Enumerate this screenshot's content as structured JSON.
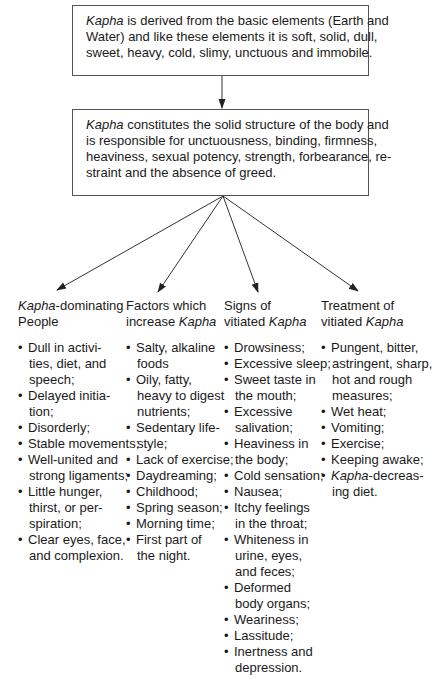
{
  "box_top": {
    "lines": [
      {
        "em": "Kapha",
        "text": " is derived from the basic elements (Earth and"
      },
      {
        "em": "",
        "text": "Water) and like these elements it is soft, solid, dull,"
      },
      {
        "em": "",
        "text": "sweet, heavy, cold, slimy, unctuous and immobile."
      }
    ]
  },
  "box_middle": {
    "lines": [
      {
        "em": "Kapha",
        "text": " constitutes the solid structure of the body and"
      },
      {
        "em": "",
        "text": "is responsible for unctuousness, binding, firmness,"
      },
      {
        "em": "",
        "text": "heaviness, sexual potency, strength, forbearance, re-"
      },
      {
        "em": "",
        "text": "straint and the absence of greed."
      }
    ]
  },
  "bullet_glyph": "•",
  "columns": [
    {
      "heading_lines": [
        {
          "em": "Kapha",
          "text": "-dominating"
        },
        {
          "em": "",
          "text": "People"
        }
      ],
      "items": [
        [
          "Dull in activi-",
          "ties, diet, and",
          "speech;"
        ],
        [
          "Delayed initia-",
          "tion;"
        ],
        [
          "Disorderly;"
        ],
        [
          "Stable movements;"
        ],
        [
          "Well-united and",
          "strong ligaments;"
        ],
        [
          "Little hunger,",
          "thirst, or per-",
          "spiration;"
        ],
        [
          "Clear eyes, face,",
          "and complexion."
        ]
      ]
    },
    {
      "heading_lines": [
        {
          "em": "",
          "text": "Factors which"
        },
        {
          "em_after": "Kapha",
          "text": "increase "
        }
      ],
      "items": [
        [
          "Salty, alkaline",
          "foods"
        ],
        [
          "Oily, fatty,",
          "heavy to digest",
          "nutrients;"
        ],
        [
          "Sedentary life-",
          "style;"
        ],
        [
          "Lack of exercise;"
        ],
        [
          "Daydreaming;"
        ],
        [
          "Childhood;"
        ],
        [
          "Spring season;"
        ],
        [
          "Morning time;"
        ],
        [
          "First part of",
          "the night."
        ]
      ]
    },
    {
      "heading_lines": [
        {
          "em": "",
          "text": "Signs of"
        },
        {
          "em_after": "Kapha",
          "text": "vitiated "
        }
      ],
      "items": [
        [
          "Drowsiness;"
        ],
        [
          "Excessive sleep;"
        ],
        [
          "Sweet taste in",
          "the mouth;"
        ],
        [
          "Excessive",
          "salivation;"
        ],
        [
          "Heaviness in",
          "the body;"
        ],
        [
          "Cold sensation;"
        ],
        [
          "Nausea;"
        ],
        [
          "Itchy feelings",
          "in the throat;"
        ],
        [
          "Whiteness in",
          "urine, eyes,",
          "and feces;"
        ],
        [
          "Deformed",
          "body organs;"
        ],
        [
          "Weariness;"
        ],
        [
          "Lassitude;"
        ],
        [
          "Inertness and",
          "depression."
        ]
      ]
    },
    {
      "heading_lines": [
        {
          "em": "",
          "text": "Treatment of"
        },
        {
          "em_after": "Kapha",
          "text": "vitiated "
        }
      ],
      "items": [
        [
          "Pungent, bitter,",
          "astringent, sharp,",
          "hot and rough",
          "measures;"
        ],
        [
          "Wet heat;"
        ],
        [
          "Vomiting;"
        ],
        [
          "Exercise;"
        ],
        [
          "Keeping awake;"
        ],
        [
          "Kapha|-decreas-",
          "ing diet."
        ]
      ]
    }
  ],
  "colors": {
    "line": "#333333",
    "border": "#555555",
    "text": "#1a1a1a"
  }
}
